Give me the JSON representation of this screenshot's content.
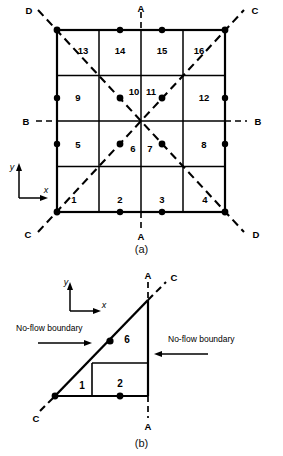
{
  "figure": {
    "caption_a": "(a)",
    "caption_b": "(b)"
  },
  "part_a": {
    "grid": {
      "rows": 4,
      "cols": 4,
      "x0": 57,
      "y0": 30,
      "x1": 225,
      "y1": 212
    },
    "cell_numbers": [
      "1",
      "2",
      "3",
      "4",
      "5",
      "6",
      "7",
      "8",
      "9",
      "10",
      "11",
      "12",
      "13",
      "14",
      "15",
      "16"
    ],
    "section_labels": {
      "a_top": "A",
      "a_bottom": "A",
      "b_left": "B",
      "b_right": "B",
      "c_topright": "C",
      "c_bottomleft": "C",
      "d_topleft": "D",
      "d_bottomright": "D"
    },
    "axes": {
      "x": "x",
      "y": "y"
    }
  },
  "part_b": {
    "cell_numbers": [
      "1",
      "2",
      "6"
    ],
    "section_labels": {
      "a_top": "A",
      "a_bottom": "A",
      "c_topright": "C",
      "c_bottomleft": "C"
    },
    "axes": {
      "x": "x",
      "y": "y"
    },
    "annotations": {
      "left_boundary": "No-flow boundary",
      "right_boundary": "No-flow boundary"
    }
  },
  "colors": {
    "line": "#000000",
    "dash": "#000000",
    "background": "#ffffff"
  }
}
